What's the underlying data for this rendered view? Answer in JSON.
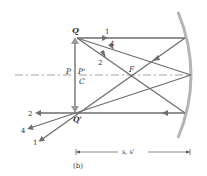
{
  "diagram": {
    "type": "concave-mirror-ray-diagram",
    "labels": {
      "object_top": "Q",
      "image_top": "Q'",
      "object_base": "P",
      "image_base": "P'",
      "center": "C",
      "focus": "F",
      "ray1": "1",
      "ray2": "2",
      "ray4": "4",
      "ray2_out": "2",
      "ray4_out": "4",
      "ray1_out": "1",
      "distance": "s, s'",
      "caption": "(b)"
    },
    "colors": {
      "ray": "#6e6e6e",
      "mirror": "#b5b5b5",
      "axis": "#8a8a8a",
      "text": "#333333"
    }
  }
}
